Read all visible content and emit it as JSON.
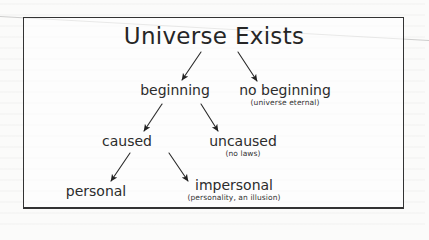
{
  "diagram": {
    "title": "Universe Exists",
    "nodes": {
      "beginning": {
        "label": "beginning"
      },
      "no_beginning": {
        "label": "no beginning",
        "note": "(universe eternal)"
      },
      "caused": {
        "label": "caused"
      },
      "uncaused": {
        "label": "uncaused",
        "note": "(no laws)"
      },
      "personal": {
        "label": "personal"
      },
      "impersonal": {
        "label": "impersonal",
        "note": "(personality, an illusion)"
      }
    },
    "edges": [
      {
        "from": "Universe Exists",
        "to": "beginning"
      },
      {
        "from": "Universe Exists",
        "to": "no beginning"
      },
      {
        "from": "beginning",
        "to": "caused"
      },
      {
        "from": "beginning",
        "to": "uncaused"
      },
      {
        "from": "caused",
        "to": "personal"
      },
      {
        "from": "caused",
        "to": "impersonal"
      }
    ],
    "colors": {
      "ink": "#2a2a2a",
      "frame": "#333333",
      "paper": "#fbfbfa"
    }
  }
}
